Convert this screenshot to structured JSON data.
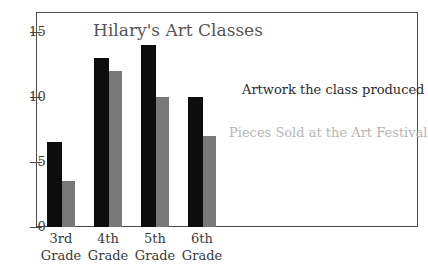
{
  "chart_data": {
    "type": "bar",
    "title": "Hilary's Art Classes",
    "xlabel": "",
    "ylabel": "",
    "categories": [
      "3rd Grade",
      "4th Grade",
      "5th Grade",
      "6th Grade"
    ],
    "category_lines": [
      [
        "3rd",
        "Grade"
      ],
      [
        "4th",
        "Grade"
      ],
      [
        "5th",
        "Grade"
      ],
      [
        "6th",
        "Grade"
      ]
    ],
    "series": [
      {
        "name": "Artwork the class produced",
        "color": "#0d0d0d",
        "values": [
          6.5,
          13,
          14,
          10
        ]
      },
      {
        "name": "Pieces Sold at the Art Festival",
        "color": "#787878",
        "values": [
          3.5,
          12,
          10,
          7
        ]
      }
    ],
    "ylim": [
      0,
      16.5
    ],
    "yticks": [
      0,
      5,
      10,
      15
    ],
    "ytick_labels": [
      "0",
      "5",
      "10",
      "15"
    ],
    "grid": false,
    "legend_position": "inside-right",
    "frame_color": "#4a4a4a",
    "title_color": "#555555",
    "background": "#ffffff"
  },
  "legend": {
    "produced_label": "Artwork the class produced",
    "sold_label": "Pieces Sold at the Art Festival",
    "produced_color": "#2b2b2b",
    "sold_color": "#b5b5b5"
  }
}
